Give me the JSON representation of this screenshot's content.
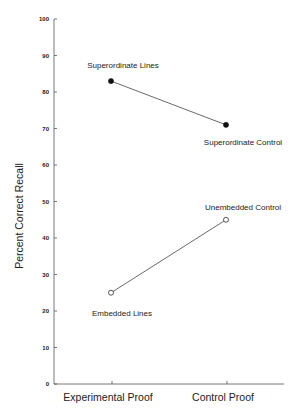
{
  "chart_data": {
    "type": "line",
    "title": "",
    "xlabel": "",
    "ylabel": "Percent Correct Recall",
    "ylim": [
      0,
      100
    ],
    "yticks": [
      0,
      10,
      20,
      30,
      40,
      50,
      60,
      70,
      80,
      90,
      100
    ],
    "categories": [
      "Experimental Proof",
      "Control Proof"
    ],
    "grid": false,
    "legend": null,
    "series": [
      {
        "name": "Superordinate",
        "marker": "filled-circle",
        "values": [
          83,
          71
        ],
        "point_labels": [
          "Superordinate Lines",
          "Superordinate Control"
        ]
      },
      {
        "name": "Embedded / Unembedded",
        "marker": "open-circle",
        "values": [
          25,
          45
        ],
        "point_labels": [
          "Embedded Lines",
          "Unembedded Control"
        ]
      }
    ],
    "annotations": [
      {
        "text": "Superordinate Lines",
        "near": "Experimental Proof",
        "value": 83,
        "position": "above"
      },
      {
        "text": "Superordinate Control",
        "near": "Control Proof",
        "value": 71,
        "position": "below"
      },
      {
        "text": "Unembedded Control",
        "near": "Control Proof",
        "value": 45,
        "position": "above"
      },
      {
        "text": "Embedded Lines",
        "near": "Experimental Proof",
        "value": 25,
        "position": "below"
      }
    ]
  },
  "colors": {
    "axis": "#555555",
    "line": "#444444",
    "marker": "#111111",
    "text": "#222222",
    "background": "#ffffff"
  }
}
